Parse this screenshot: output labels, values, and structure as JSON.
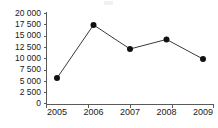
{
  "chart_data": {
    "type": "line",
    "title": "",
    "subtitle": "",
    "xlabel": "",
    "ylabel": "",
    "categories": [
      "2005",
      "2006",
      "2007",
      "2008",
      "2009"
    ],
    "x": [
      2005,
      2006,
      2007,
      2008,
      2009
    ],
    "values": [
      5800,
      17500,
      12200,
      14300,
      10000
    ],
    "series": [
      {
        "name": "",
        "values": [
          5800,
          17500,
          12200,
          14300,
          10000
        ]
      }
    ],
    "ylim": [
      0,
      20000
    ],
    "xlim": [
      2005,
      2009
    ],
    "ytick_values": [
      0,
      2500,
      5000,
      7500,
      10000,
      12500,
      15000,
      17500,
      20000
    ],
    "ytick_labels": [
      "0",
      "2 500",
      "5 000",
      "7 500",
      "10 000",
      "12 500",
      "15 000",
      "17 500",
      "20 000"
    ],
    "xtick_labels": [
      "2005",
      "2006",
      "2007",
      "2008",
      "2009"
    ],
    "grid": false,
    "legend": false,
    "legend_position": "none",
    "marker": "filled-circle",
    "annotations": [],
    "colors": {
      "line": "#3a3a3a",
      "marker": "#111111",
      "axis": "#5a5a5a",
      "text": "#1a1a1a",
      "background": "#ffffff"
    }
  },
  "ytick_labels": {
    "0": "20 000",
    "1": "17 500",
    "2": "15 000",
    "3": "12 500",
    "4": "10 000",
    "5": "7 500",
    "6": "5 000",
    "7": "2 500",
    "8": "0"
  },
  "xtick_labels": {
    "0": "2005",
    "1": "2006",
    "2": "2007",
    "3": "2008",
    "4": "2009"
  }
}
